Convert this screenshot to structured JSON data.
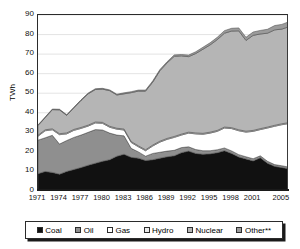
{
  "chart_data": {
    "type": "area",
    "stacked": true,
    "title": "",
    "xlabel": "",
    "ylabel": "TWh",
    "ylim": [
      0,
      90
    ],
    "ytick_values": [
      0,
      10,
      20,
      30,
      40,
      50,
      60,
      70,
      80,
      90
    ],
    "ytick_labels": [
      "0",
      "10",
      "20",
      "30",
      "40",
      "50",
      "60",
      "70",
      "80",
      "90"
    ],
    "xlim": [
      1971,
      2006
    ],
    "xtick_labels": [
      "1971",
      "1974",
      "1977",
      "1980",
      "1983",
      "1986",
      "1989",
      "1992",
      "1995",
      "1998",
      "2001",
      "2005"
    ],
    "xtick_values": [
      1971,
      1974,
      1977,
      1980,
      1983,
      1986,
      1989,
      1992,
      1995,
      1998,
      2001,
      2005
    ],
    "grid": "horizontal",
    "legend_position": "bottom",
    "x": [
      1971,
      1972,
      1973,
      1974,
      1975,
      1976,
      1977,
      1978,
      1979,
      1980,
      1981,
      1982,
      1983,
      1984,
      1985,
      1986,
      1987,
      1988,
      1989,
      1990,
      1991,
      1992,
      1993,
      1994,
      1995,
      1996,
      1997,
      1998,
      1999,
      2000,
      2001,
      2002,
      2003,
      2004,
      2005,
      2006
    ],
    "series": [
      {
        "name": "Coal",
        "color": "#111111",
        "values": [
          8.8,
          10.0,
          9.5,
          8.6,
          10.0,
          11.0,
          12.0,
          13.2,
          14.2,
          15.2,
          16.0,
          17.8,
          18.8,
          17.2,
          16.8,
          15.6,
          16.0,
          16.8,
          17.5,
          18.0,
          19.6,
          20.4,
          19.2,
          18.8,
          19.0,
          19.6,
          20.6,
          19.2,
          17.4,
          16.4,
          15.4,
          17.0,
          14.2,
          12.6,
          12.0,
          11.3
        ]
      },
      {
        "name": "Oil",
        "color": "#8f8f8f",
        "values": [
          17.2,
          17.2,
          19.0,
          15.4,
          15.8,
          16.4,
          16.6,
          16.8,
          17.2,
          16.0,
          13.6,
          10.8,
          9.4,
          4.6,
          3.2,
          2.2,
          3.2,
          3.0,
          2.9,
          2.8,
          2.6,
          2.2,
          2.0,
          1.8,
          1.6,
          1.5,
          1.4,
          1.3,
          1.2,
          1.1,
          1.1,
          1.0,
          1.0,
          0.9,
          0.9,
          0.9
        ]
      },
      {
        "name": "Gas",
        "color": "#ffffff",
        "values": [
          2.0,
          3.6,
          2.8,
          4.8,
          3.4,
          3.6,
          3.4,
          3.2,
          3.4,
          3.4,
          3.0,
          3.0,
          3.0,
          3.0,
          2.6,
          2.8,
          3.8,
          5.2,
          6.0,
          6.6,
          6.4,
          7.0,
          8.0,
          8.4,
          9.0,
          9.4,
          10.2,
          11.4,
          12.2,
          12.6,
          14.0,
          13.4,
          17.0,
          19.6,
          21.0,
          22.3
        ]
      },
      {
        "name": "Hydro",
        "color": "#e6e6e6",
        "values": [
          0.5,
          0.5,
          0.5,
          0.5,
          0.5,
          0.5,
          0.5,
          0.5,
          0.5,
          0.5,
          0.5,
          0.5,
          0.5,
          0.5,
          0.5,
          0.5,
          0.5,
          0.5,
          0.5,
          0.5,
          0.5,
          0.5,
          0.5,
          0.5,
          0.5,
          0.5,
          0.5,
          0.5,
          0.5,
          0.5,
          0.5,
          0.5,
          0.5,
          0.5,
          0.5,
          0.5
        ]
      },
      {
        "name": "Nuclear",
        "color": "#b5b5b5",
        "values": [
          5.0,
          6.2,
          9.8,
          12.2,
          9.0,
          11.0,
          13.8,
          16.0,
          16.6,
          17.0,
          18.2,
          17.0,
          18.0,
          25.0,
          28.0,
          30.0,
          32.2,
          36.0,
          38.6,
          41.0,
          40.0,
          38.6,
          40.6,
          43.0,
          44.6,
          46.4,
          48.0,
          49.4,
          50.6,
          46.4,
          48.6,
          48.4,
          48.0,
          48.8,
          48.4,
          49.0
        ]
      },
      {
        "name": "Other**",
        "color": "#9b9b9b",
        "values": [
          0.3,
          0.3,
          0.3,
          0.3,
          0.3,
          0.3,
          0.3,
          0.4,
          0.4,
          0.4,
          0.4,
          0.4,
          0.5,
          0.5,
          0.5,
          0.5,
          0.6,
          0.6,
          0.6,
          0.7,
          0.7,
          0.8,
          0.9,
          1.0,
          1.1,
          1.2,
          1.3,
          1.4,
          1.5,
          1.6,
          1.7,
          1.8,
          2.0,
          2.2,
          2.4,
          2.6
        ]
      }
    ]
  },
  "axis": {
    "ylabel": "TWh"
  },
  "legend": {
    "items": [
      {
        "label": "Coal",
        "color": "#111111"
      },
      {
        "label": "Oil",
        "color": "#8f8f8f"
      },
      {
        "label": "Gas",
        "color": "#ffffff"
      },
      {
        "label": "Hydro",
        "color": "#ececec"
      },
      {
        "label": "Nuclear",
        "color": "#b5b5b5"
      },
      {
        "label": "Other**",
        "color": "#9b9b9b"
      }
    ]
  }
}
